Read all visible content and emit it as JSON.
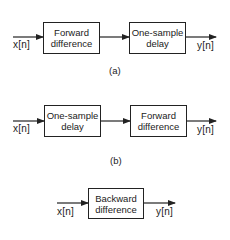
{
  "diagrams": [
    {
      "caption": "(a)",
      "input": "x[n]",
      "output": "y[n]",
      "blocks": [
        {
          "line1": "Forward",
          "line2": "difference"
        },
        {
          "line1": "One-sample",
          "line2": "delay"
        }
      ]
    },
    {
      "caption": "(b)",
      "input": "x[n]",
      "output": "y[n]",
      "blocks": [
        {
          "line1": "One-sample",
          "line2": "delay"
        },
        {
          "line1": "Forward",
          "line2": "difference"
        }
      ]
    },
    {
      "caption": "",
      "input": "x[n]",
      "output": "y[n]",
      "blocks": [
        {
          "line1": "Backward",
          "line2": "difference"
        }
      ]
    }
  ],
  "colors": {
    "line": "#222222",
    "background": "#ffffff"
  }
}
